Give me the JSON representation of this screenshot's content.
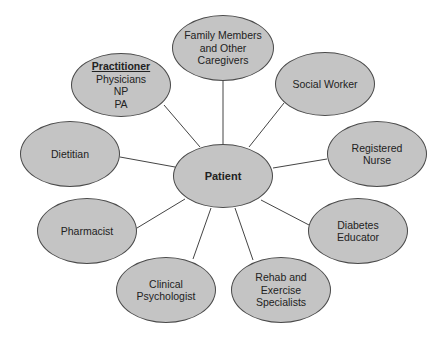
{
  "diagram": {
    "type": "hub-and-spoke",
    "colors": {
      "node_fill": "#c4c4c4",
      "node_stroke": "#4a4a4a",
      "line": "#444444",
      "background": "#ffffff"
    },
    "center": {
      "id": "patient",
      "label": "Patient",
      "cx": 223,
      "cy": 176,
      "rx": 50,
      "ry": 32
    },
    "nodes": [
      {
        "id": "family",
        "lines": [
          "Family Members",
          "and Other",
          "Caregivers"
        ],
        "cx": 223,
        "cy": 48,
        "rx": 51,
        "ry": 33,
        "edge": [
          223,
          81,
          223,
          144
        ]
      },
      {
        "id": "practitioner",
        "heading": "Practitioner",
        "lines": [
          "Physicians",
          "NP",
          "PA"
        ],
        "cx": 121,
        "cy": 85,
        "rx": 50,
        "ry": 32,
        "edge": [
          164,
          105,
          200,
          147
        ]
      },
      {
        "id": "social-worker",
        "lines": [
          "Social Worker"
        ],
        "cx": 325,
        "cy": 84,
        "rx": 50,
        "ry": 32,
        "edge": [
          284,
          103,
          249,
          147
        ]
      },
      {
        "id": "dietitian",
        "lines": [
          "Dietitian"
        ],
        "cx": 70,
        "cy": 154,
        "rx": 50,
        "ry": 33,
        "edge": [
          120,
          157,
          175,
          167
        ]
      },
      {
        "id": "registered-nurse",
        "lines": [
          "Registered",
          "Nurse"
        ],
        "cx": 377,
        "cy": 154,
        "rx": 50,
        "ry": 33,
        "edge": [
          327,
          159,
          273,
          168
        ]
      },
      {
        "id": "pharmacist",
        "lines": [
          "Pharmacist"
        ],
        "cx": 87,
        "cy": 231,
        "rx": 50,
        "ry": 33,
        "edge": [
          137,
          228,
          185,
          199
        ]
      },
      {
        "id": "diabetes-educator",
        "lines": [
          "Diabetes",
          "Educator"
        ],
        "cx": 358,
        "cy": 231,
        "rx": 50,
        "ry": 33,
        "edge": [
          309,
          225,
          261,
          200
        ]
      },
      {
        "id": "clinical-psychologist",
        "lines": [
          "Clinical",
          "Psychologist"
        ],
        "cx": 166,
        "cy": 290,
        "rx": 50,
        "ry": 33,
        "edge": [
          193,
          259,
          211,
          208
        ]
      },
      {
        "id": "rehab-exercise",
        "lines": [
          "Rehab and",
          "Exercise",
          "Specialists"
        ],
        "cx": 281,
        "cy": 290,
        "rx": 50,
        "ry": 33,
        "edge": [
          253,
          260,
          235,
          208
        ]
      }
    ]
  }
}
